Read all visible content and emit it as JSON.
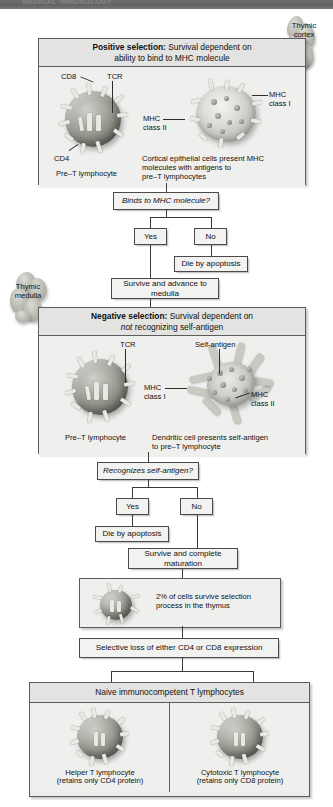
{
  "top_bar": {
    "text": "MEDICAL IMMUNOLOGY"
  },
  "callouts": {
    "cortex": {
      "line1": "Thymic",
      "line2": "cortex"
    },
    "medulla": {
      "line1": "Thymic",
      "line2": "medulla"
    }
  },
  "positive_panel": {
    "header_bold": "Positive selection:",
    "header_rest": " Survival dependent on",
    "header_line2": "ability to bind to MHC molecule",
    "labels": {
      "cd8": "CD8",
      "tcr": "TCR",
      "cd4": "CD4",
      "pre_t": "Pre–T lymphocyte",
      "mhc_class_i_l1": "MHC",
      "mhc_class_i_l2": "class I",
      "mhc_class_ii_l1": "MHC",
      "mhc_class_ii_l2": "class II",
      "caption_l1": "Cortical epithelial cells present MHC",
      "caption_l2": "molecules with antigens to",
      "caption_l3": "pre–T lymphocytes"
    }
  },
  "decision_1": {
    "question": "Binds to MHC molecule?",
    "yes": "Yes",
    "no": "No",
    "no_outcome": "Die by apoptosis",
    "yes_outcome_l1": "Survive and advance to",
    "yes_outcome_l2": "medulla"
  },
  "negative_panel": {
    "header_bold": "Negative selection:",
    "header_rest": " Survival dependent on",
    "header_line2_ital": "not",
    "header_line2_rest": " recognizing self-antigen",
    "labels": {
      "tcr": "TCR",
      "self_antigen": "Self-antigen",
      "mhc_class_i_l1": "MHC",
      "mhc_class_i_l2": "class I",
      "mhc_class_ii_l1": "MHC",
      "mhc_class_ii_l2": "class II",
      "pre_t": "Pre–T lymphocyte",
      "caption_l1": "Dendritic cell presents self-antigen",
      "caption_l2": "to pre–T lymphocyte"
    }
  },
  "decision_2": {
    "question": "Recognizes self-antigen?",
    "yes": "Yes",
    "no": "No",
    "yes_outcome": "Die by apoptosis",
    "no_outcome_l1": "Survive and complete",
    "no_outcome_l2": "maturation"
  },
  "survival_panel": {
    "text_l1": "2% of cells survive selection",
    "text_l2": "process in the thymus"
  },
  "selective_loss": {
    "text": "Selective loss of either CD4 or CD8 expression"
  },
  "naive_panel": {
    "header": "Naive immunocompetent T lymphocytes",
    "left_l1": "Helper T lymphocyte",
    "left_l2": "(retains only CD4 protein)",
    "right_l1": "Cytotoxic T lymphocyte",
    "right_l2": "(retains only CD8 protein)"
  },
  "colors": {
    "panel_fill": "#ececeb",
    "panel_body": "#efefee",
    "box_fill": "#f2f2f1",
    "border": "#4a4a4a",
    "connector": "#3a3a3a",
    "top_bar": "#6e6e6e"
  }
}
